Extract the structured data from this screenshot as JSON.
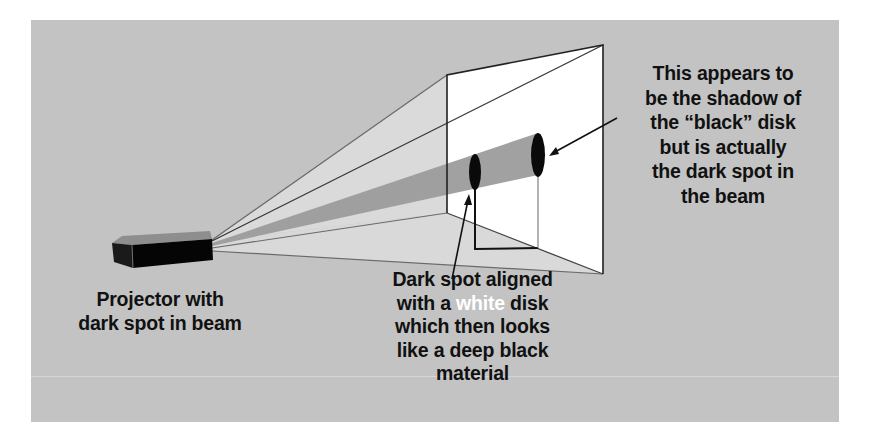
{
  "diagram": {
    "colors": {
      "background": "#c3c3c3",
      "beam_light": "#dcdcdc",
      "dark_spot_beam": "#9a9a9a",
      "screen": "#ffffff",
      "outline": "#2a2a2a",
      "projector": "#0d0d0d",
      "highlight_text": "#ffffff"
    },
    "elements": [
      "projector",
      "light-beam",
      "dark-spot-beam",
      "white-disk",
      "shadow-on-screen",
      "projection-screen"
    ]
  },
  "labels": {
    "projector": {
      "line1": "Projector with",
      "line2": "dark spot in beam"
    },
    "white_disk": {
      "line1": "Dark spot aligned",
      "line2_before": "with a ",
      "line2_highlight": "white",
      "line2_after": " disk",
      "line3": "which then looks",
      "line4": "like a deep black",
      "line5": "material"
    },
    "shadow": {
      "line1": "This appears to",
      "line2": "be the shadow of",
      "line3": "the “black” disk",
      "line4": "but is actually",
      "line5": "the dark spot in",
      "line6": "the beam"
    }
  }
}
